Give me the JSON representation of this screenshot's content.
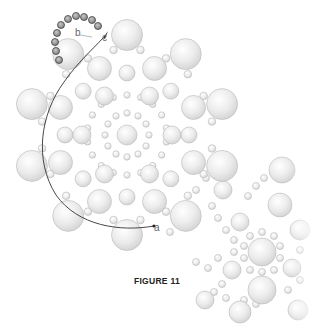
{
  "figure": {
    "caption": "FIGURE 11",
    "labels": [
      {
        "id": "a",
        "text": "a",
        "x": 154,
        "y": 231
      },
      {
        "id": "b",
        "text": "b",
        "x": 75,
        "y": 36
      },
      {
        "id": "c",
        "text": "c",
        "x": 102,
        "y": 41
      }
    ],
    "colors": {
      "bead_fill": "#e8e8e8",
      "bead_stroke": "#b8b8b8",
      "dark_bead_fill": "#9a9a9a",
      "dark_bead_stroke": "#444444",
      "thread": "#333333"
    },
    "rosette": {
      "center": [
        127,
        135
      ],
      "center_bead_r": 10,
      "inner_ring": {
        "radius": 22,
        "count": 12,
        "bead_r": 3.2
      },
      "mid_ring": {
        "radius": 45,
        "count": 6,
        "bead_r": 9,
        "offset_deg": 0
      },
      "mid_small_ring": {
        "radius": 40,
        "count": 18,
        "bead_r": 3.2,
        "offset_deg": 10
      },
      "outer_ring": {
        "radius": 72,
        "count": 8,
        "bead_r": 12,
        "offset_deg": 22.5
      },
      "between_ring": {
        "radius": 62,
        "count": 8,
        "bead_r": 8,
        "offset_deg": 0
      },
      "rim_ring": {
        "radius": 100,
        "count": 10,
        "bead_r": 15.5,
        "offset_deg": 18
      },
      "rim_small_ring": {
        "radius": 86,
        "count": 20,
        "bead_r": 3.8,
        "offset_deg": 9
      }
    },
    "secondary": {
      "center": [
        262,
        252
      ],
      "large_beads": [
        [
          262,
          252,
          14
        ],
        [
          262,
          290,
          14
        ],
        [
          232,
          270,
          9
        ],
        [
          292,
          268,
          9
        ],
        [
          240,
          222,
          9
        ],
        [
          280,
          205,
          12
        ],
        [
          223,
          190,
          9
        ],
        [
          300,
          230,
          10
        ],
        [
          282,
          170,
          13
        ],
        [
          205,
          300,
          9
        ],
        [
          240,
          312,
          11
        ],
        [
          298,
          310,
          10
        ]
      ],
      "small_beads": [
        [
          250,
          236,
          3.5
        ],
        [
          262,
          232,
          3.5
        ],
        [
          274,
          236,
          3.5
        ],
        [
          244,
          246,
          3.5
        ],
        [
          244,
          258,
          3.5
        ],
        [
          250,
          270,
          3.5
        ],
        [
          274,
          270,
          3.5
        ],
        [
          280,
          258,
          3.5
        ],
        [
          280,
          246,
          3.5
        ],
        [
          262,
          272,
          3.5
        ],
        [
          212,
          206,
          3.5
        ],
        [
          218,
          218,
          3.5
        ],
        [
          226,
          230,
          3.5
        ],
        [
          234,
          240,
          3.5
        ],
        [
          196,
          190,
          3.5
        ],
        [
          206,
          178,
          3.5
        ],
        [
          248,
          196,
          3.5
        ],
        [
          256,
          186,
          3.5
        ],
        [
          264,
          178,
          3.5
        ],
        [
          222,
          284,
          3.5
        ],
        [
          214,
          292,
          3.5
        ],
        [
          226,
          298,
          3.5
        ],
        [
          288,
          290,
          3.5
        ],
        [
          300,
          280,
          3.5
        ],
        [
          300,
          250,
          3.5
        ],
        [
          244,
          300,
          3.5
        ],
        [
          256,
          304,
          3.5
        ],
        [
          234,
          252,
          3.5
        ],
        [
          190,
          214,
          3.5
        ],
        [
          180,
          224,
          3.5
        ],
        [
          170,
          232,
          3.5
        ],
        [
          196,
          262,
          3.5
        ],
        [
          208,
          268,
          3.5
        ],
        [
          218,
          258,
          3.5
        ]
      ]
    },
    "dark_beads": [
      [
        61,
        25,
        3.5
      ],
      [
        68,
        19,
        3.5
      ],
      [
        76,
        16,
        3.5
      ],
      [
        84,
        17,
        3.5
      ],
      [
        92,
        20,
        3.5
      ],
      [
        98,
        26,
        3.5
      ],
      [
        57,
        33,
        3.5
      ],
      [
        55,
        42,
        3.5
      ],
      [
        56,
        51,
        3.5
      ],
      [
        59,
        60,
        3.5
      ]
    ]
  }
}
